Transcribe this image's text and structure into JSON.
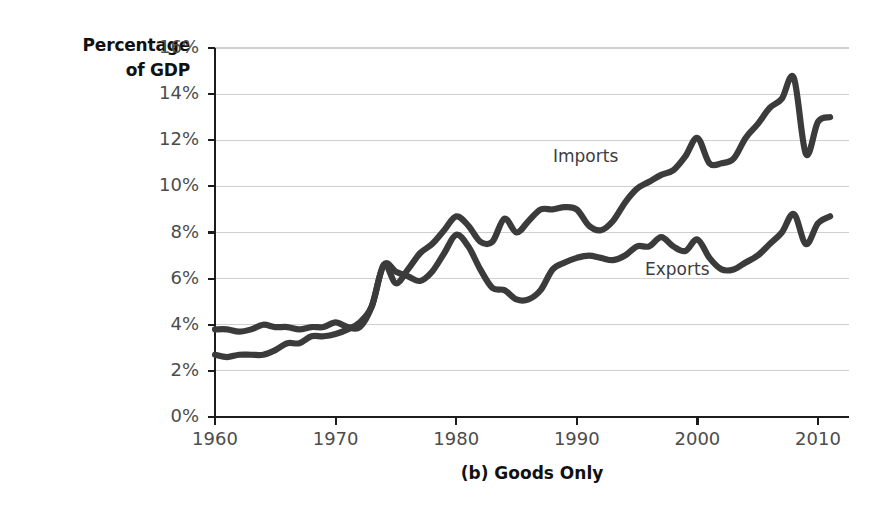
{
  "figure": {
    "caption": "(b) Goods Only",
    "y_axis_title_line1": "Percentage",
    "y_axis_title_line2": "of GDP",
    "line_color": "#3b3b3b",
    "grid_color": "#cfcfcf",
    "axis_color": "#1c1c1c",
    "background": "#ffffff"
  },
  "chart_data": {
    "type": "line",
    "title": "(b) Goods Only",
    "xlabel": "",
    "ylabel": "Percentage of GDP",
    "xlim": [
      1960,
      2011
    ],
    "ylim": [
      0,
      16
    ],
    "grid": true,
    "grid_axis": "y",
    "legend": "inline-labels",
    "xticks": [
      1960,
      1970,
      1980,
      1990,
      2000,
      2010
    ],
    "xticklabels": [
      "1960",
      "1970",
      "1980",
      "1990",
      "2000",
      "2010"
    ],
    "yticks": [
      0,
      2,
      4,
      6,
      8,
      10,
      12,
      14,
      16
    ],
    "yticklabels": [
      "0%",
      "2%",
      "4%",
      "6%",
      "8%",
      "10%",
      "12%",
      "14%",
      "16%"
    ],
    "x": [
      1960,
      1961,
      1962,
      1963,
      1964,
      1965,
      1966,
      1967,
      1968,
      1969,
      1970,
      1971,
      1972,
      1973,
      1974,
      1975,
      1976,
      1977,
      1978,
      1979,
      1980,
      1981,
      1982,
      1983,
      1984,
      1985,
      1986,
      1987,
      1988,
      1989,
      1990,
      1991,
      1992,
      1993,
      1994,
      1995,
      1996,
      1997,
      1998,
      1999,
      2000,
      2001,
      2002,
      2003,
      2004,
      2005,
      2006,
      2007,
      2008,
      2009,
      2010,
      2011
    ],
    "series": [
      {
        "name": "Exports",
        "label": "Exports",
        "values": [
          3.8,
          3.8,
          3.7,
          3.8,
          4.0,
          3.9,
          3.9,
          3.8,
          3.9,
          3.9,
          4.1,
          3.9,
          3.9,
          4.8,
          6.6,
          6.3,
          6.1,
          5.9,
          6.3,
          7.1,
          7.9,
          7.4,
          6.4,
          5.6,
          5.5,
          5.1,
          5.1,
          5.5,
          6.4,
          6.7,
          6.9,
          7.0,
          6.9,
          6.8,
          7.0,
          7.4,
          7.4,
          7.8,
          7.4,
          7.2,
          7.7,
          6.9,
          6.4,
          6.4,
          6.7,
          7.0,
          7.5,
          8.0,
          8.8,
          7.5,
          8.4,
          8.7
        ]
      },
      {
        "name": "Imports",
        "label": "Imports",
        "values": [
          2.7,
          2.6,
          2.7,
          2.7,
          2.7,
          2.9,
          3.2,
          3.2,
          3.5,
          3.5,
          3.6,
          3.8,
          4.1,
          4.8,
          6.6,
          5.8,
          6.4,
          7.1,
          7.5,
          8.1,
          8.7,
          8.3,
          7.6,
          7.6,
          8.6,
          8.0,
          8.5,
          9.0,
          9.0,
          9.1,
          9.0,
          8.3,
          8.1,
          8.5,
          9.3,
          9.9,
          10.2,
          10.5,
          10.7,
          11.3,
          12.1,
          11.0,
          11.0,
          11.2,
          12.1,
          12.7,
          13.4,
          13.8,
          14.7,
          11.4,
          12.8,
          13.0
        ]
      }
    ]
  }
}
